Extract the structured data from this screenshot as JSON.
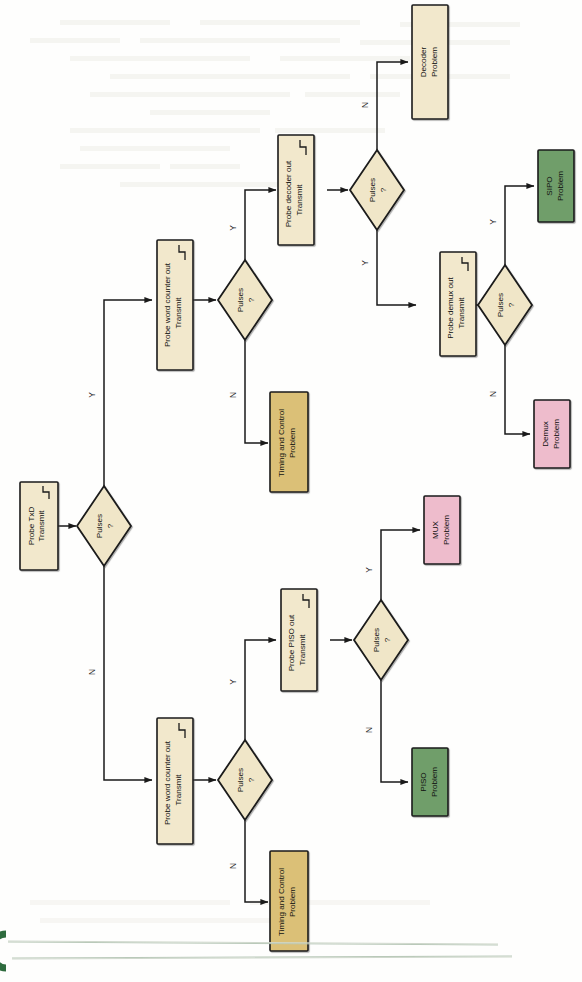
{
  "diagram": {
    "orientation": "rotated-90-ccw",
    "colors": {
      "process_fill": "#f2e8cc",
      "decision_fill": "#f0e6c8",
      "timing_fill": "#dbc077",
      "green_fill": "#6f9e6b",
      "pink_fill": "#eebccc",
      "stroke": "#1a1a1a",
      "deco_green": "#2e6b3e",
      "page_bg": "#fefefd"
    },
    "nodes": [
      {
        "id": "probe_txd",
        "kind": "process",
        "label_line1": "Probe TxD",
        "label_line2": "Transmit",
        "pulse_icon": true,
        "fill": "#f2e8cc"
      },
      {
        "id": "d_txd",
        "kind": "decision",
        "label_line1": "Pulses",
        "label_line2": "?",
        "pulse_icon": false,
        "fill": "#f0e6c8"
      },
      {
        "id": "probe_wc_top",
        "kind": "process",
        "label_line1": "Probe word counter out",
        "label_line2": "Transmit",
        "pulse_icon": true,
        "fill": "#f2e8cc"
      },
      {
        "id": "d_wc_top",
        "kind": "decision",
        "label_line1": "Pulses",
        "label_line2": "?",
        "pulse_icon": false,
        "fill": "#f0e6c8"
      },
      {
        "id": "timing_top",
        "kind": "terminal",
        "label_line1": "Timing and Control",
        "label_line2": "Problem",
        "pulse_icon": false,
        "fill": "#dbc077"
      },
      {
        "id": "probe_decoder",
        "kind": "process",
        "label_line1": "Probe decoder out",
        "label_line2": "Transmit",
        "pulse_icon": true,
        "fill": "#f2e8cc"
      },
      {
        "id": "d_decoder",
        "kind": "decision",
        "label_line1": "Pulses",
        "label_line2": "?",
        "pulse_icon": false,
        "fill": "#f0e6c8"
      },
      {
        "id": "decoder_problem",
        "kind": "terminal",
        "label_line1": "Decoder",
        "label_line2": "Problem",
        "pulse_icon": false,
        "fill": "#f2e8cc"
      },
      {
        "id": "probe_demux",
        "kind": "process",
        "label_line1": "Probe demux out",
        "label_line2": "Transmit",
        "pulse_icon": true,
        "fill": "#f2e8cc"
      },
      {
        "id": "d_demux",
        "kind": "decision",
        "label_line1": "Pulses",
        "label_line2": "?",
        "pulse_icon": false,
        "fill": "#f0e6c8"
      },
      {
        "id": "sipo_problem",
        "kind": "terminal",
        "label_line1": "SIPO",
        "label_line2": "Problem",
        "pulse_icon": false,
        "fill": "#6f9e6b"
      },
      {
        "id": "demux_problem",
        "kind": "terminal",
        "label_line1": "Demux",
        "label_line2": "Problem",
        "pulse_icon": false,
        "fill": "#eebccc"
      },
      {
        "id": "probe_wc_bot",
        "kind": "process",
        "label_line1": "Probe word counter out",
        "label_line2": "Transmit",
        "pulse_icon": true,
        "fill": "#f2e8cc"
      },
      {
        "id": "d_wc_bot",
        "kind": "decision",
        "label_line1": "Pulses",
        "label_line2": "?",
        "pulse_icon": false,
        "fill": "#f0e6c8"
      },
      {
        "id": "timing_bot",
        "kind": "terminal",
        "label_line1": "Timing and Control",
        "label_line2": "Problem",
        "pulse_icon": false,
        "fill": "#dbc077"
      },
      {
        "id": "probe_piso",
        "kind": "process",
        "label_line1": "Probe PISO out",
        "label_line2": "Transmit",
        "pulse_icon": true,
        "fill": "#f2e8cc"
      },
      {
        "id": "d_piso",
        "kind": "decision",
        "label_line1": "Pulses",
        "label_line2": "?",
        "pulse_icon": false,
        "fill": "#f0e6c8"
      },
      {
        "id": "mux_problem",
        "kind": "terminal",
        "label_line1": "MUX",
        "label_line2": "Problem",
        "pulse_icon": false,
        "fill": "#eebccc"
      },
      {
        "id": "piso_problem",
        "kind": "terminal",
        "label_line1": "PISO",
        "label_line2": "Problem",
        "pulse_icon": false,
        "fill": "#6f9e6b"
      }
    ],
    "edge_labels": {
      "txd_yes": "Y",
      "txd_no": "N",
      "wc_top_yes": "Y",
      "wc_top_no": "N",
      "decoder_yes": "Y",
      "decoder_no": "N",
      "demux_yes": "Y",
      "demux_no": "N",
      "wc_bot_yes": "Y",
      "wc_bot_no": "N",
      "piso_yes": "Y",
      "piso_no": "N"
    }
  }
}
